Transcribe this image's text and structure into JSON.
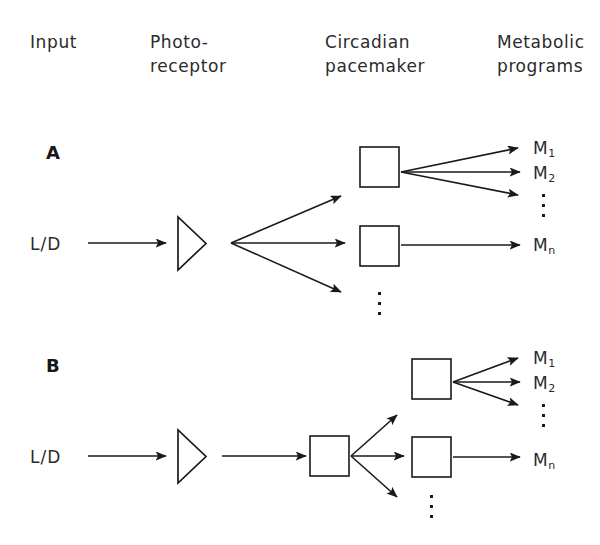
{
  "figure": {
    "background_color": "#ffffff",
    "ink_color": "#1a1a1a"
  },
  "columns": [
    {
      "id": "input",
      "label": "Input"
    },
    {
      "id": "receptor",
      "label": "Photo-\nreceptor"
    },
    {
      "id": "pacemaker",
      "label": "Circadian\npacemaker"
    },
    {
      "id": "programs",
      "label": "Metabolic\nprograms"
    }
  ],
  "panels": [
    {
      "id": "A",
      "label": "A",
      "input_label": "L/D",
      "outputs": [
        {
          "id": "m1",
          "base": "M",
          "sub": "1"
        },
        {
          "id": "m2",
          "base": "M",
          "sub": "2"
        },
        {
          "id": "mn",
          "base": "M",
          "sub": "n"
        }
      ],
      "ellipsis": [
        "outputs-upper",
        "pacemakers-lower"
      ]
    },
    {
      "id": "B",
      "label": "B",
      "input_label": "L/D",
      "outputs": [
        {
          "id": "m1",
          "base": "M",
          "sub": "1"
        },
        {
          "id": "m2",
          "base": "M",
          "sub": "2"
        },
        {
          "id": "mn",
          "base": "M",
          "sub": "n"
        }
      ],
      "ellipsis": [
        "outputs-upper",
        "pacemakers-lower"
      ]
    }
  ]
}
